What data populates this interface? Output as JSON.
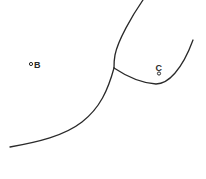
{
  "diagram": {
    "labels": {
      "B": "B",
      "C": "C"
    },
    "points": [
      {
        "name": "B",
        "x": 31,
        "y": 64
      },
      {
        "name": "C",
        "x": 159,
        "y": 73
      }
    ],
    "curves": [
      {
        "name": "upper-boundary",
        "from": [
          143,
          0
        ],
        "to": [
          114,
          68
        ]
      },
      {
        "name": "lower-boundary",
        "from": [
          114,
          68
        ],
        "to": [
          10,
          147
        ]
      },
      {
        "name": "right-boundary",
        "from": [
          114,
          68
        ],
        "to": [
          193,
          40
        ]
      }
    ],
    "line_color": "#2a2a2a"
  }
}
